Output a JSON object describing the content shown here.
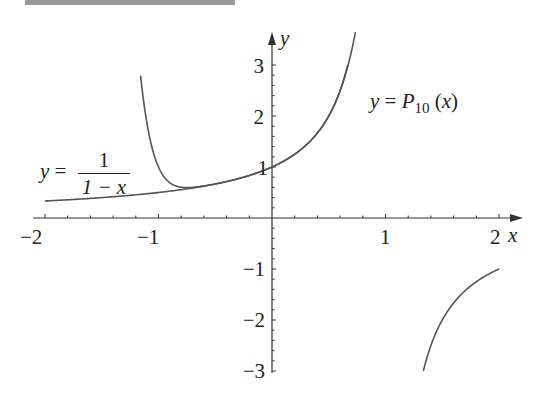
{
  "chart_data": {
    "type": "line",
    "title": "",
    "xlabel": "x",
    "ylabel": "y",
    "xlim": [
      -2,
      2
    ],
    "ylim": [
      -3,
      3
    ],
    "x_ticks": [
      "-2",
      "-1",
      "1",
      "2"
    ],
    "y_ticks": [
      "3",
      "2",
      "1",
      "-1",
      "-2",
      "-3"
    ],
    "grid": false,
    "series": [
      {
        "name": "y = 1/(1-x)",
        "formula": "1/(1-x)",
        "segments": [
          {
            "x_range": [
              -2,
              0.667
            ],
            "points": [
              [
                -2,
                0.333
              ],
              [
                -1.5,
                0.4
              ],
              [
                -1,
                0.5
              ],
              [
                -0.5,
                0.667
              ],
              [
                0,
                1
              ],
              [
                0.5,
                2
              ],
              [
                0.667,
                3
              ]
            ]
          },
          {
            "x_range": [
              1.333,
              2
            ],
            "points": [
              [
                1.333,
                -3
              ],
              [
                1.5,
                -2
              ],
              [
                1.75,
                -1.333
              ],
              [
                2,
                -1
              ]
            ]
          }
        ]
      },
      {
        "name": "y = P10(x)",
        "formula": "sum_{k=0}^{10} x^k",
        "x_range": [
          -1.16,
          0.73
        ],
        "points": [
          [
            -1.16,
            3
          ],
          [
            -1,
            1
          ],
          [
            -0.75,
            0.57
          ],
          [
            -0.5,
            0.667
          ],
          [
            0,
            1
          ],
          [
            0.5,
            2
          ],
          [
            0.73,
            3
          ]
        ]
      }
    ]
  },
  "labels": {
    "y_axis": "y",
    "x_axis": "x",
    "ticks": {
      "xm2": "−2",
      "xm1": "−1",
      "x1": "1",
      "x2": "2",
      "y3": "3",
      "y2": "2",
      "y1": "1",
      "ym1": "−1",
      "ym2": "−2",
      "ym3": "−3"
    },
    "annotation_geometric": {
      "lhs": "y",
      "eq": " = ",
      "num": "1",
      "den": "1 − x"
    },
    "annotation_poly": {
      "lhs": "y",
      "eq": " = ",
      "P": "P",
      "sub": "10",
      "arg_open": " (",
      "arg": "x",
      "arg_close": ")"
    }
  },
  "colors": {
    "curve": "#555555",
    "axis": "#333333",
    "text": "#222222",
    "topbar": "#9a9a9a"
  }
}
